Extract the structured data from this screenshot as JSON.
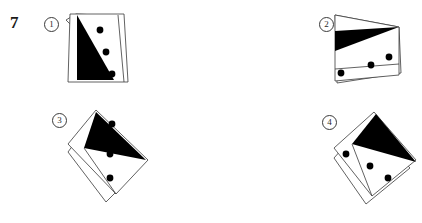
{
  "question": {
    "number": "7",
    "type": "spatial-rotation-multiple-choice"
  },
  "options": [
    {
      "id": "option-1",
      "marker": "①",
      "label": "1"
    },
    {
      "id": "option-2",
      "marker": "②",
      "label": "2"
    },
    {
      "id": "option-3",
      "marker": "③",
      "label": "3"
    },
    {
      "id": "option-4",
      "marker": "④",
      "label": "4"
    }
  ],
  "colors": {
    "ink": "#000000",
    "outline": "#3a3a3a",
    "paper": "#ffffff",
    "fill_black": "#000000"
  },
  "figures": [
    {
      "id": "figure-1",
      "option": "1",
      "description": "upright sheared quadrilateral card, black triangle at left, three dots descending to the right",
      "card_outline": "8,4 62,4 66,72 6,72",
      "back_outline": "4,10 14,4 58,6 64,70",
      "black_triangle": "15,5 15,70 52,70",
      "dots": [
        {
          "cx": 38,
          "cy": 20,
          "r": 3.4
        },
        {
          "cx": 44,
          "cy": 42,
          "r": 3.4
        },
        {
          "cx": 50,
          "cy": 64,
          "r": 3.4
        }
      ]
    },
    {
      "id": "figure-2",
      "option": "2",
      "description": "card rotated roughly 90 degrees, black triangle across the top, three dots along the lower band",
      "card_outline": "2,2 66,14 66,62 2,68",
      "back_outline": "2,2 66,14 68,60 4,70",
      "black_triangle": "2,18 66,14 2,38",
      "dots": [
        {
          "cx": 56,
          "cy": 44,
          "r": 3.4
        },
        {
          "cx": 38,
          "cy": 52,
          "r": 3.4
        },
        {
          "cx": 8,
          "cy": 60,
          "r": 3.4
        }
      ]
    },
    {
      "id": "figure-3",
      "option": "3",
      "description": "card rotated about 45 degrees clockwise, black triangle top-left pointing right, three dots down the middle",
      "card_outline": "30,2 82,52 50,86 2,36",
      "back_outline": "24,14 72,62 40,94 2,44",
      "black_triangle": "30,4 80,52 18,40",
      "dots": [
        {
          "cx": 46,
          "cy": 16,
          "r": 3.4
        },
        {
          "cx": 44,
          "cy": 46,
          "r": 3.4
        },
        {
          "cx": 44,
          "cy": 70,
          "r": 3.4
        }
      ]
    },
    {
      "id": "figure-4",
      "option": "4",
      "description": "card rotated about 45 degrees counter-clockwise, black triangle upper-right, three dots on the lower band",
      "card_outline": "42,2 84,50 40,86 2,38",
      "back_outline": "34,12 78,58 34,94 2,48",
      "black_triangle": "44,4 84,52 20,34",
      "dots": [
        {
          "cx": 14,
          "cy": 44,
          "r": 3.4
        },
        {
          "cx": 38,
          "cy": 56,
          "r": 3.4
        },
        {
          "cx": 56,
          "cy": 68,
          "r": 3.4
        }
      ]
    }
  ]
}
